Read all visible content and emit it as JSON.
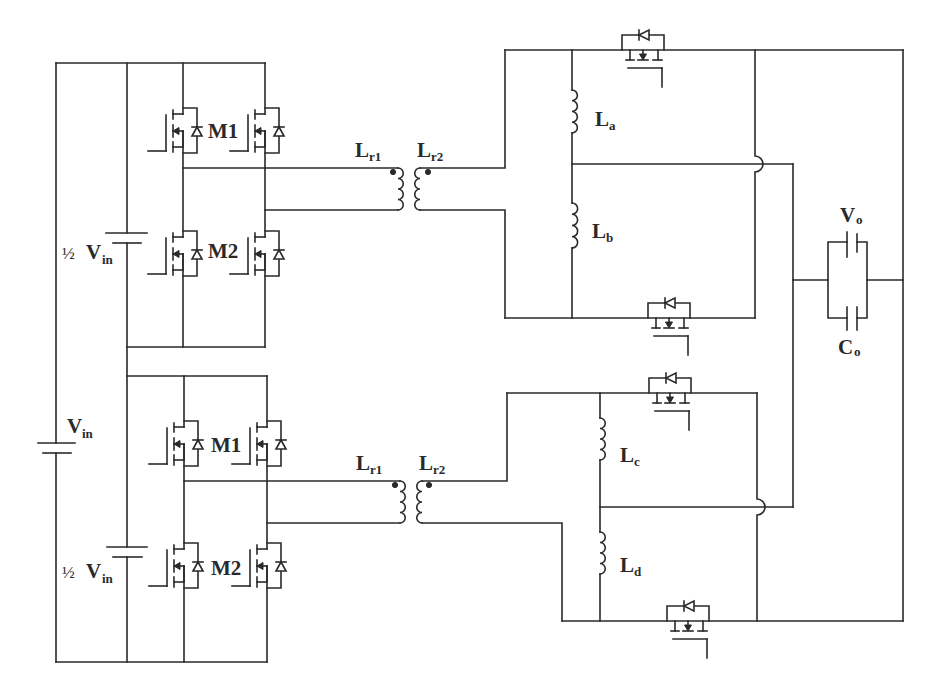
{
  "diagram": {
    "source": {
      "label": "V",
      "sub": "in"
    },
    "upper_bridge": {
      "half_vin": {
        "prefix": "½",
        "label": "V",
        "sub": "in"
      },
      "m1": "M1",
      "m2": "M2"
    },
    "lower_bridge": {
      "half_vin": {
        "prefix": "½",
        "label": "V",
        "sub": "in"
      },
      "m1": "M1",
      "m2": "M2"
    },
    "upper_transformer": {
      "primary": {
        "label": "L",
        "sub": "r1"
      },
      "secondary": {
        "label": "L",
        "sub": "r2"
      }
    },
    "lower_transformer": {
      "primary": {
        "label": "L",
        "sub": "r1"
      },
      "secondary": {
        "label": "L",
        "sub": "r2"
      }
    },
    "inductors": {
      "a": {
        "label": "L",
        "sub": "a"
      },
      "b": {
        "label": "L",
        "sub": "b"
      },
      "c": {
        "label": "L",
        "sub": "c"
      },
      "d": {
        "label": "L",
        "sub": "d"
      }
    },
    "output": {
      "voltage": {
        "label": "V",
        "sub": "o"
      },
      "capacitor": {
        "label": "C",
        "sub": "o"
      }
    },
    "colors": {
      "wire": "#2a2a2a",
      "background": "#ffffff"
    }
  }
}
